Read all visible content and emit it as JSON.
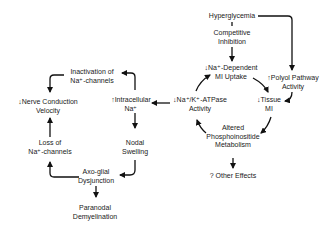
{
  "diagram": {
    "nodes": {
      "hyperglycemia": {
        "lines": [
          "Hyperglycemia"
        ]
      },
      "competitive_inhibition": {
        "lines": [
          "Competitive",
          "Inhibition"
        ]
      },
      "na_dependent_mi_uptake": {
        "lines": [
          "↓Na⁺-Dependent",
          "MI Uptake"
        ]
      },
      "polyol_pathway": {
        "lines": [
          "↑Polyol Pathway",
          "Activity"
        ]
      },
      "tissue_mi": {
        "lines": [
          "↓Tissue",
          "MI"
        ]
      },
      "na_k_atpase": {
        "lines": [
          "↓Na⁺/K⁺-ATPase",
          "Activity"
        ]
      },
      "phosphoinositide": {
        "lines": [
          "Altered",
          "Phosphoinositide",
          "Metabolism"
        ]
      },
      "other_effects": {
        "lines": [
          "? Other Effects"
        ]
      },
      "intracellular_na": {
        "lines": [
          "↑Intracellular",
          "Na⁺"
        ]
      },
      "inactivation_na_channels": {
        "lines": [
          "Inactivation of",
          "Na⁺-channels"
        ]
      },
      "nerve_conduction": {
        "lines": [
          "↓Nerve Conduction",
          "Velocity"
        ]
      },
      "loss_na_channels": {
        "lines": [
          "Loss of",
          "Na⁺-channels"
        ]
      },
      "nodal_swelling": {
        "lines": [
          "Nodal",
          "Swelling"
        ]
      },
      "axo_glial": {
        "lines": [
          "Axo-glial",
          "Dysjunction"
        ]
      },
      "paranodal": {
        "lines": [
          "Paranodal",
          "Demyelination"
        ]
      }
    },
    "edges": [
      [
        "hyperglycemia",
        "competitive_inhibition"
      ],
      [
        "competitive_inhibition",
        "na_dependent_mi_uptake"
      ],
      [
        "hyperglycemia",
        "polyol_pathway"
      ],
      [
        "polyol_pathway",
        "tissue_mi"
      ],
      [
        "na_dependent_mi_uptake",
        "tissue_mi"
      ],
      [
        "tissue_mi",
        "phosphoinositide"
      ],
      [
        "phosphoinositide",
        "na_k_atpase"
      ],
      [
        "na_k_atpase",
        "na_dependent_mi_uptake"
      ],
      [
        "phosphoinositide",
        "other_effects"
      ],
      [
        "na_k_atpase",
        "intracellular_na"
      ],
      [
        "intracellular_na",
        "inactivation_na_channels"
      ],
      [
        "inactivation_na_channels",
        "nerve_conduction"
      ],
      [
        "intracellular_na",
        "nodal_swelling"
      ],
      [
        "nodal_swelling",
        "axo_glial"
      ],
      [
        "axo_glial",
        "loss_na_channels"
      ],
      [
        "loss_na_channels",
        "nerve_conduction"
      ],
      [
        "axo_glial",
        "paranodal"
      ]
    ],
    "colors": {
      "ink": "#111111",
      "background": "#ffffff"
    }
  }
}
